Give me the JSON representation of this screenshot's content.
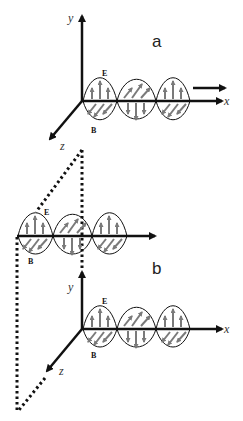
{
  "diagram": {
    "panels": [
      {
        "label": "a",
        "axes": {
          "x": "x",
          "y": "y",
          "z": "z"
        },
        "field_labels": {
          "electric": "E",
          "magnetic": "B"
        }
      },
      {
        "label": "b",
        "axes": {
          "x": "x",
          "y": "y",
          "z": "z"
        },
        "field_labels": {
          "electric": "E",
          "magnetic": "B"
        }
      }
    ],
    "colors": {
      "stroke": "#111111",
      "field_arrows": "#7a7a7a",
      "background": "#ffffff"
    }
  }
}
